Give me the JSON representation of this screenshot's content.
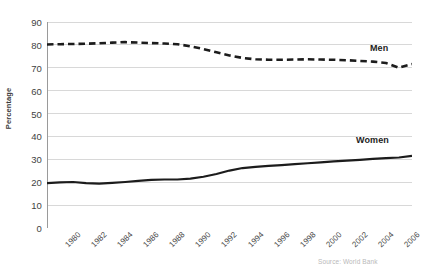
{
  "chart_data": {
    "type": "line",
    "title": "",
    "subtitle": "",
    "xlabel": "",
    "ylabel": "Percentage",
    "ylim": [
      0,
      90
    ],
    "ytick_step": 10,
    "yticks": [
      0,
      10,
      20,
      30,
      40,
      50,
      60,
      70,
      80,
      90
    ],
    "ytick_labels": [
      "0",
      "10",
      "20",
      "30",
      "40",
      "50",
      "60",
      "70",
      "80",
      "90"
    ],
    "grid": true,
    "grid_axis": "y",
    "legend_position": "inline-end-of-line",
    "x": [
      1980,
      1981,
      1982,
      1983,
      1984,
      1985,
      1986,
      1987,
      1988,
      1989,
      1990,
      1991,
      1992,
      1993,
      1994,
      1995,
      1996,
      1997,
      1998,
      1999,
      2000,
      2001,
      2002,
      2003,
      2004,
      2005,
      2006,
      2007,
      2008
    ],
    "xtick_labels": [
      "1980",
      "1982",
      "1984",
      "1986",
      "1988",
      "1990",
      "1992",
      "1994",
      "1996",
      "1998",
      "2000",
      "2002",
      "2004",
      "2006",
      "2008"
    ],
    "xtick_label_values": [
      1980,
      1982,
      1984,
      1986,
      1988,
      1990,
      1992,
      1994,
      1996,
      1998,
      2000,
      2002,
      2004,
      2006,
      2008
    ],
    "xtick_label_rotation": -45,
    "series": [
      {
        "name": "Men",
        "label": "Men",
        "color": "#1c1c1c",
        "style": "dashed",
        "width": 2.6,
        "values": [
          80.2,
          80.3,
          80.4,
          80.5,
          80.7,
          81.0,
          81.2,
          81.0,
          80.8,
          80.6,
          80.3,
          79.4,
          78.2,
          76.8,
          75.4,
          74.3,
          73.7,
          73.5,
          73.5,
          73.6,
          73.7,
          73.6,
          73.5,
          73.3,
          73.0,
          72.7,
          72.1,
          70.0,
          71.6
        ]
      },
      {
        "name": "Women",
        "label": "Women",
        "color": "#1c1c1c",
        "style": "solid",
        "width": 2.2,
        "values": [
          19.6,
          19.9,
          20.1,
          19.6,
          19.4,
          19.7,
          20.1,
          20.6,
          21.0,
          21.2,
          21.2,
          21.6,
          22.4,
          23.6,
          25.1,
          26.2,
          26.7,
          27.1,
          27.5,
          27.9,
          28.3,
          28.7,
          29.1,
          29.4,
          29.8,
          30.2,
          30.5,
          30.8,
          31.5
        ]
      }
    ]
  },
  "annotations": {
    "source_note": "Source: World Bank"
  }
}
